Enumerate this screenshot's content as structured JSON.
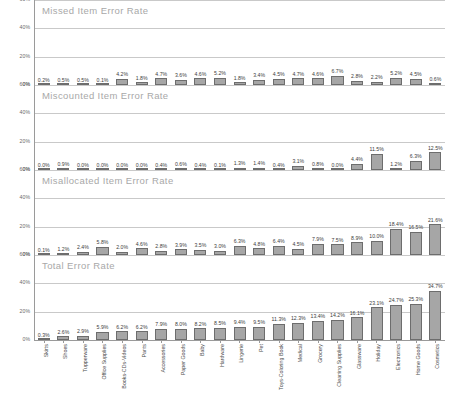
{
  "categories": [
    "Skirts",
    "Shoes",
    "Tupperware",
    "Office Supplies",
    "Books-CDs-Videos",
    "Pants",
    "Accessories",
    "Paper Goods",
    "Baby",
    "Hardware",
    "Lingerie",
    "Pet",
    "Toys-Coloring Book",
    "Medical",
    "Grocery",
    "Cleaning Supplies",
    "Glassware",
    "Holiday",
    "Electronics",
    "Home Goods",
    "Cosmetics"
  ],
  "yticks": [
    "60%",
    "40%",
    "20%",
    "0%"
  ],
  "colors": {
    "bar_fill": "#a6a6a6",
    "bar_border": "#6d6d6d",
    "grid": "#c9c9c9",
    "axis": "#9a9a9a",
    "title": "#a8a8a8",
    "label": "#3d3d3d"
  },
  "panels": [
    {
      "title": "Missed Item Error Rate",
      "labels": [
        "0.2%",
        "0.5%",
        "0.5%",
        "0.1%",
        "4.2%",
        "1.8%",
        "4.7%",
        "3.6%",
        "4.6%",
        "5.2%",
        "1.8%",
        "3.4%",
        "4.5%",
        "4.7%",
        "4.6%",
        "6.7%",
        "2.8%",
        "2.2%",
        "5.2%",
        "4.5%",
        "0.6%"
      ],
      "values": [
        0.2,
        0.5,
        0.5,
        0.1,
        4.2,
        1.8,
        4.7,
        3.6,
        4.6,
        5.2,
        1.8,
        3.4,
        4.5,
        4.7,
        4.6,
        6.7,
        2.8,
        2.2,
        5.2,
        4.5,
        0.6
      ]
    },
    {
      "title": "Miscounted Item Error Rate",
      "labels": [
        "0.0%",
        "0.9%",
        "0.0%",
        "0.0%",
        "0.0%",
        "0.0%",
        "0.4%",
        "0.6%",
        "0.4%",
        "0.1%",
        "1.3%",
        "1.4%",
        "0.4%",
        "3.1%",
        "0.8%",
        "0.0%",
        "4.4%",
        "11.5%",
        "1.2%",
        "6.3%",
        "12.5%"
      ],
      "values": [
        0.0,
        0.9,
        0.0,
        0.0,
        0.0,
        0.0,
        0.4,
        0.6,
        0.4,
        0.1,
        1.3,
        1.4,
        0.4,
        3.1,
        0.8,
        0.0,
        4.4,
        11.5,
        1.2,
        6.3,
        12.5
      ]
    },
    {
      "title": "Misallocated Item Error Rate",
      "labels": [
        "0.1%",
        "1.2%",
        "2.4%",
        "5.8%",
        "2.0%",
        "4.6%",
        "2.8%",
        "3.9%",
        "3.5%",
        "3.0%",
        "6.3%",
        "4.8%",
        "6.4%",
        "4.5%",
        "7.9%",
        "7.5%",
        "8.9%",
        "10.0%",
        "18.4%",
        "16.5%",
        "21.6%"
      ],
      "values": [
        0.1,
        1.2,
        2.4,
        5.8,
        2.0,
        4.6,
        2.8,
        3.9,
        3.5,
        3.0,
        6.3,
        4.8,
        6.4,
        4.5,
        7.9,
        7.5,
        8.9,
        10.0,
        18.4,
        16.5,
        21.6
      ]
    },
    {
      "title": "Total Error Rate",
      "labels": [
        "0.3%",
        "2.6%",
        "2.9%",
        "5.9%",
        "6.2%",
        "6.2%",
        "7.9%",
        "8.0%",
        "8.2%",
        "8.5%",
        "9.4%",
        "9.5%",
        "11.3%",
        "12.3%",
        "13.4%",
        "14.2%",
        "16.1%",
        "23.1%",
        "24.7%",
        "25.3%",
        "34.7%"
      ],
      "values": [
        0.3,
        2.6,
        2.9,
        5.9,
        6.2,
        6.2,
        7.9,
        8.0,
        8.2,
        8.5,
        9.4,
        9.5,
        11.3,
        12.3,
        13.4,
        14.2,
        16.1,
        23.1,
        24.7,
        25.3,
        34.7
      ]
    }
  ],
  "chart_data": {
    "type": "bar",
    "xlabel": "",
    "ylabel": "",
    "ylim": [
      0,
      60
    ],
    "ytick_values": [
      0,
      20,
      40,
      60
    ],
    "grid": true,
    "legend": "none",
    "categories": [
      "Skirts",
      "Shoes",
      "Tupperware",
      "Office Supplies",
      "Books-CDs-Videos",
      "Pants",
      "Accessories",
      "Paper Goods",
      "Baby",
      "Hardware",
      "Lingerie",
      "Pet",
      "Toys-Coloring Book",
      "Medical",
      "Grocery",
      "Cleaning Supplies",
      "Glassware",
      "Holiday",
      "Electronics",
      "Home Goods",
      "Cosmetics"
    ],
    "series": [
      {
        "name": "Missed Item Error Rate",
        "values": [
          0.2,
          0.5,
          0.5,
          0.1,
          4.2,
          1.8,
          4.7,
          3.6,
          4.6,
          5.2,
          1.8,
          3.4,
          4.5,
          4.7,
          4.6,
          6.7,
          2.8,
          2.2,
          5.2,
          4.5,
          0.6
        ]
      },
      {
        "name": "Miscounted Item Error Rate",
        "values": [
          0.0,
          0.9,
          0.0,
          0.0,
          0.0,
          0.0,
          0.4,
          0.6,
          0.4,
          0.1,
          1.3,
          1.4,
          0.4,
          3.1,
          0.8,
          0.0,
          4.4,
          11.5,
          1.2,
          6.3,
          12.5
        ]
      },
      {
        "name": "Misallocated Item Error Rate",
        "values": [
          0.1,
          1.2,
          2.4,
          5.8,
          2.0,
          4.6,
          2.8,
          3.9,
          3.5,
          3.0,
          6.3,
          4.8,
          6.4,
          4.5,
          7.9,
          7.5,
          8.9,
          10.0,
          18.4,
          16.5,
          21.6
        ]
      },
      {
        "name": "Total Error Rate",
        "values": [
          0.3,
          2.6,
          2.9,
          5.9,
          6.2,
          6.2,
          7.9,
          8.0,
          8.2,
          8.5,
          9.4,
          9.5,
          11.3,
          12.3,
          13.4,
          14.2,
          16.1,
          23.1,
          24.7,
          25.3,
          34.7
        ]
      }
    ]
  }
}
